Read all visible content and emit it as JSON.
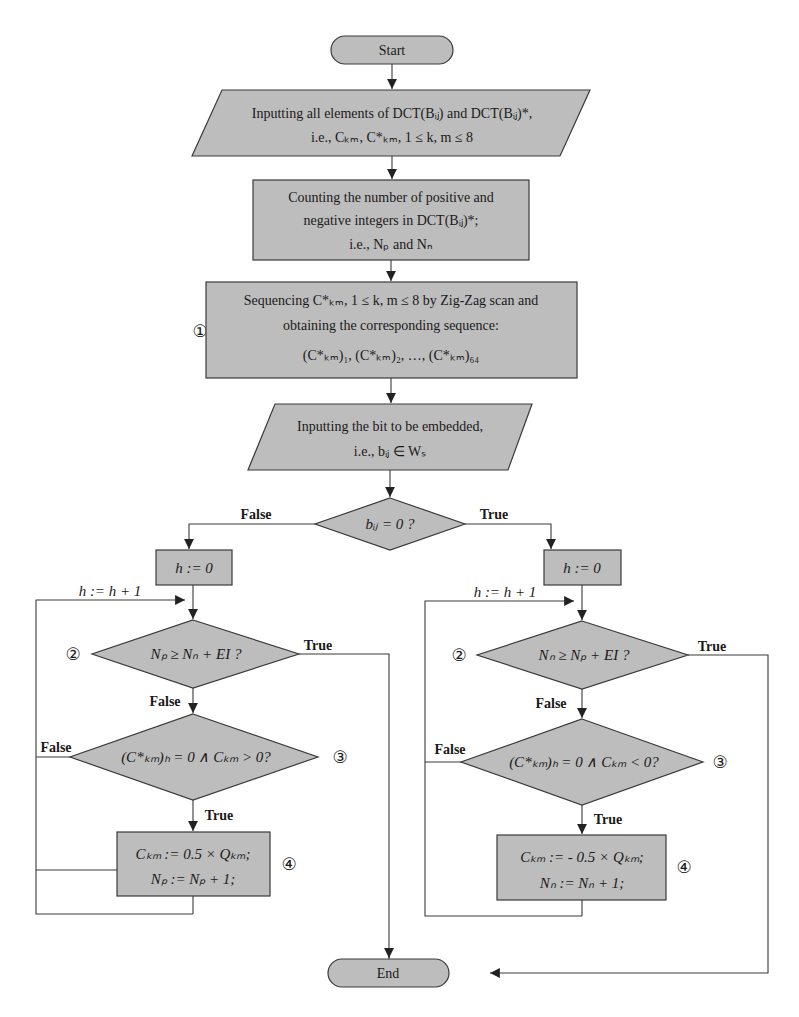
{
  "flowchart": {
    "start": "Start",
    "end": "End",
    "input_elements": {
      "line1": "Inputting all elements of  DCT(Bᵢⱼ) and DCT(Bᵢⱼ)*,",
      "line2": "i.e., Cₖₘ, C*ₖₘ, 1 ≤ k, m ≤ 8"
    },
    "count_box": {
      "line1": "Counting the number of positive and",
      "line2": "negative integers in DCT(Bᵢⱼ)*;",
      "line3": "i.e., Nₚ and Nₙ"
    },
    "sequence_box": {
      "marker": "①",
      "line1": "Sequencing C*ₖₘ, 1 ≤ k, m ≤ 8 by Zig-Zag scan and",
      "line2": "obtaining the corresponding sequence:",
      "line3": "(C*ₖₘ)₁, (C*ₖₘ)₂, …, (C*ₖₘ)₆₄"
    },
    "input_bit": {
      "line1": "Inputting the bit to be embedded,",
      "line2": "i.e., bᵢⱼ ∈ Wₛ"
    },
    "decision_bit": {
      "text": "bᵢⱼ = 0 ?",
      "false_label": "False",
      "true_label": "True"
    },
    "left_branch": {
      "init": "h := 0",
      "increment": "h := h + 1",
      "decision2": {
        "marker": "②",
        "text": "Nₚ ≥ Nₙ + EI  ?",
        "true_label": "True",
        "false_label": "False"
      },
      "decision3": {
        "marker": "③",
        "text": "(C*ₖₘ)ₕ = 0  ∧  Cₖₘ > 0?",
        "true_label": "True",
        "false_label": "False"
      },
      "process4": {
        "marker": "④",
        "line1": "Cₖₘ := 0.5 × Qₖₘ;",
        "line2": "Nₚ := Nₚ + 1;"
      }
    },
    "right_branch": {
      "init": "h := 0",
      "increment": "h := h + 1",
      "decision2": {
        "marker": "②",
        "text": "Nₙ ≥ Nₚ + EI  ?",
        "true_label": "True",
        "false_label": "False"
      },
      "decision3": {
        "marker": "③",
        "text": "(C*ₖₘ)ₕ = 0  ∧  Cₖₘ < 0?",
        "true_label": "True",
        "false_label": "False"
      },
      "process4": {
        "marker": "④",
        "line1": "Cₖₘ := - 0.5 × Qₖₘ;",
        "line2": "Nₙ := Nₙ + 1;"
      }
    }
  }
}
